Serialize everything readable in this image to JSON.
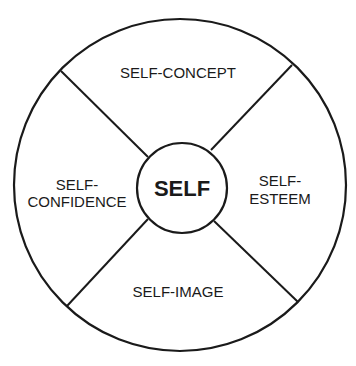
{
  "diagram": {
    "center": {
      "label": "SELF"
    },
    "segments": [
      {
        "position": "top",
        "lines": [
          "SELF-CONCEPT"
        ]
      },
      {
        "position": "right",
        "lines": [
          "SELF-",
          "ESTEEM"
        ]
      },
      {
        "position": "bottom",
        "lines": [
          "SELF-IMAGE"
        ]
      },
      {
        "position": "left",
        "lines": [
          "SELF-",
          "CONFIDENCE"
        ]
      }
    ],
    "stroke_color": "#1a1a1a",
    "background_color": "#ffffff"
  }
}
